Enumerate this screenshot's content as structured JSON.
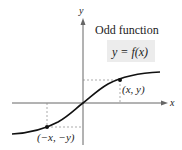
{
  "title": "Odd function",
  "equation": "y = f(x)",
  "axes": {
    "x_label": "x",
    "y_label": "y"
  },
  "points": [
    {
      "label": "(x, y)"
    },
    {
      "label": "(−x, −y)"
    }
  ],
  "colors": {
    "curve": "#111111",
    "axis": "#555555",
    "box": "#ececec",
    "dash": "#888888"
  }
}
